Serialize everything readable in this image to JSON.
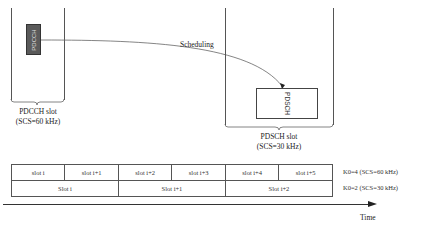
{
  "diagram": {
    "pdcch_slot": {
      "channel_label": "PDCCH",
      "label_line1": "PDCCH slot",
      "label_line2": "(SCS=60 kHz)"
    },
    "pdsch_slot": {
      "channel_label": "PDSCH",
      "label_line1": "PDSCH slot",
      "label_line2": "(SCS=30 kHz)"
    },
    "scheduling_label": "Scheduling",
    "timeline": {
      "row_60khz": {
        "cells": [
          "slot i",
          "slot i+1",
          "slot i+2",
          "slot i+3",
          "slot i+4",
          "slot i+5"
        ],
        "k0_label": "K0=4 (SCS=60 kHz)"
      },
      "row_30khz": {
        "cells": [
          "Slot i",
          "Slot i+1",
          "Slot i+2"
        ],
        "k0_label": "K0=2 (SCS=30 kHz)"
      },
      "axis_label": "Time"
    },
    "colors": {
      "pdcch_fill": "#5a5a5a",
      "line": "#555555"
    }
  }
}
